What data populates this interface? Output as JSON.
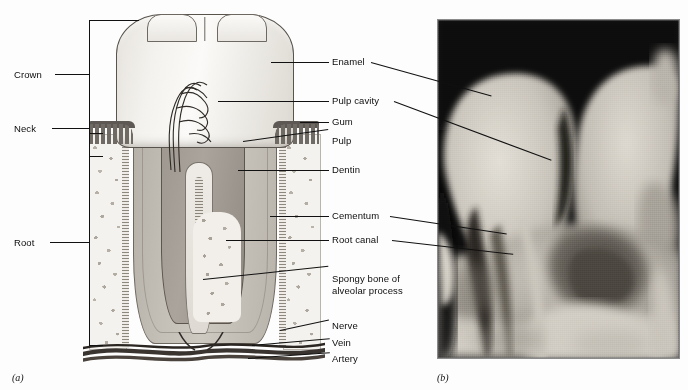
{
  "figure": {
    "panels": [
      {
        "id": "(a)",
        "kind": "illustration",
        "description": "Cross-section drawing of a molar tooth"
      },
      {
        "id": "(b)",
        "kind": "radiograph",
        "description": "Dental x-ray of molar teeth"
      }
    ]
  },
  "left_labels": [
    {
      "name": "crown",
      "text": "Crown"
    },
    {
      "name": "neck",
      "text": "Neck"
    },
    {
      "name": "root",
      "text": "Root"
    }
  ],
  "right_labels": [
    {
      "name": "enamel",
      "text": "Enamel"
    },
    {
      "name": "pulp-cavity",
      "text": "Pulp cavity"
    },
    {
      "name": "gum",
      "text": "Gum"
    },
    {
      "name": "pulp",
      "text": "Pulp"
    },
    {
      "name": "dentin",
      "text": "Dentin"
    },
    {
      "name": "cementum",
      "text": "Cementum"
    },
    {
      "name": "root-canal",
      "text": "Root canal"
    },
    {
      "name": "spongy-bone",
      "text": "Spongy bone of\nalveolar process"
    },
    {
      "name": "nerve",
      "text": "Nerve"
    },
    {
      "name": "vein",
      "text": "Vein"
    },
    {
      "name": "artery",
      "text": "Artery"
    }
  ],
  "panel_ids": {
    "a": "(a)",
    "b": "(b)"
  },
  "colors": {
    "background": "#fdfdfd",
    "ink": "#111111",
    "enamel": "#f4f2ee",
    "dentin": "#c3beb6",
    "pulp": "#9a948c",
    "gum": "#6f6a64",
    "bone": "#f4f2ee",
    "xray_dark": "#0a0a0a",
    "xray_bright": "#d8d4cc"
  }
}
